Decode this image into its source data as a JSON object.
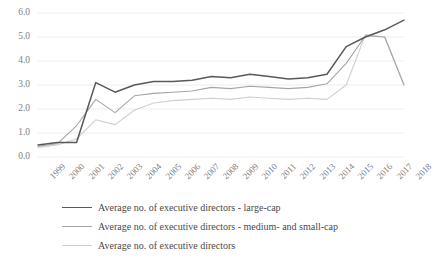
{
  "chart_data": {
    "type": "line",
    "title": "",
    "subtitle": "",
    "xlabel": "",
    "ylabel": "",
    "grid": true,
    "grid_axis": "y",
    "legend_position": "bottom-left",
    "ylim": [
      0.0,
      6.0
    ],
    "ytick_labels": [
      "0.0",
      "1.0",
      "2.0",
      "3.0",
      "4.0",
      "5.0",
      "6.0"
    ],
    "ytick_values": [
      0.0,
      1.0,
      2.0,
      3.0,
      4.0,
      5.0,
      6.0
    ],
    "categories": [
      "1999",
      "2000",
      "2001",
      "2002",
      "2003",
      "2004",
      "2005",
      "2006",
      "2007",
      "2008",
      "2009",
      "2010",
      "2011",
      "2012",
      "2013",
      "2014",
      "2015",
      "2016",
      "2017",
      "2018"
    ],
    "series": [
      {
        "name": "Average no. of executive directors - large-cap",
        "color": "#595959",
        "values": [
          0.5,
          0.6,
          0.6,
          3.1,
          2.7,
          3.0,
          3.15,
          3.15,
          3.2,
          3.35,
          3.3,
          3.45,
          3.35,
          3.25,
          3.3,
          3.45,
          4.6,
          5.0,
          5.3,
          5.7
        ]
      },
      {
        "name": "Average no. of executive directors - medium- and small-cap",
        "color": "#a6a6a6",
        "values": [
          0.45,
          0.55,
          1.3,
          2.4,
          1.85,
          2.55,
          2.65,
          2.7,
          2.75,
          2.9,
          2.85,
          2.95,
          2.9,
          2.85,
          2.9,
          3.05,
          3.9,
          5.05,
          5.0,
          3.0
        ]
      },
      {
        "name": "Average no. of executive directors",
        "color": "#cfcfcf",
        "values": [
          0.4,
          0.5,
          0.75,
          1.55,
          1.35,
          1.95,
          2.25,
          2.35,
          2.4,
          2.45,
          2.4,
          2.5,
          2.45,
          2.4,
          2.45,
          2.4,
          3.0,
          5.1,
          5.0,
          3.0
        ]
      }
    ]
  },
  "legend": {
    "entries": [
      {
        "label": "Average no. of executive directors - large-cap",
        "color": "#595959"
      },
      {
        "label": "Average no. of executive directors - medium- and small-cap",
        "color": "#a6a6a6"
      },
      {
        "label": "Average no. of executive directors",
        "color": "#cfcfcf"
      }
    ]
  }
}
